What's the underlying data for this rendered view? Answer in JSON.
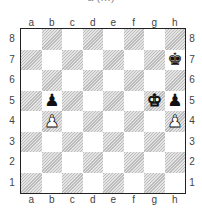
{
  "caption": "a (…)",
  "board": {
    "files": [
      "a",
      "b",
      "c",
      "d",
      "e",
      "f",
      "g",
      "h"
    ],
    "ranks": [
      "8",
      "7",
      "6",
      "5",
      "4",
      "3",
      "2",
      "1"
    ],
    "pieces": [
      {
        "square": "h7",
        "type": "king",
        "color": "black",
        "glyph": "♚"
      },
      {
        "square": "b5",
        "type": "pawn",
        "color": "black",
        "glyph": "♟"
      },
      {
        "square": "g5",
        "type": "king",
        "color": "white",
        "glyph": "♚"
      },
      {
        "square": "h5",
        "type": "pawn",
        "color": "black",
        "glyph": "♟"
      },
      {
        "square": "b4",
        "type": "pawn",
        "color": "white",
        "glyph": "♟"
      },
      {
        "square": "h4",
        "type": "pawn",
        "color": "white",
        "glyph": "♟"
      }
    ]
  }
}
